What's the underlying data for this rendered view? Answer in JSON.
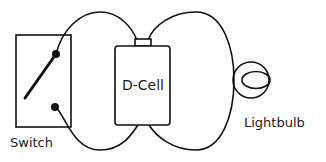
{
  "diagram": {
    "title": "",
    "type": "circuit",
    "stroke_color": "#111111",
    "background": "#ffffff",
    "components": [
      {
        "id": "switch",
        "label": "Switch",
        "kind": "switch (open)"
      },
      {
        "id": "battery",
        "label": "D-Cell",
        "kind": "battery"
      },
      {
        "id": "bulb",
        "label": "Lightbulb",
        "kind": "lightbulb"
      }
    ],
    "connections": [
      {
        "from": "switch",
        "to": "battery",
        "note": "loop wire top and bottom"
      },
      {
        "from": "battery",
        "to": "bulb",
        "note": "loop wire top and bottom"
      }
    ]
  },
  "labels": {
    "switch": "Switch",
    "battery": "D-Cell",
    "bulb": "Lightbulb"
  }
}
